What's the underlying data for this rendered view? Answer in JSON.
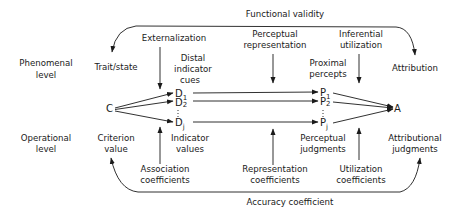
{
  "diagram": {
    "top_arc_label": "Functional validity",
    "bottom_arc_label": "Accuracy coefficient",
    "levels": {
      "phenomenal": [
        "Phenomenal",
        "level"
      ],
      "operational": [
        "Operational",
        "level"
      ]
    },
    "phenomenal_row": {
      "trait_state": "Trait/state",
      "externalization": "Externalization",
      "distal_cues": [
        "Distal",
        "indicator",
        "cues"
      ],
      "perceptual_representation": [
        "Perceptual",
        "representation"
      ],
      "proximal_percepts": [
        "Proximal",
        "percepts"
      ],
      "inferential_utilization": [
        "Inferential",
        "utilization"
      ],
      "attribution": "Attribution"
    },
    "nodes": {
      "criterion": "C",
      "distal": [
        {
          "base": "D",
          "sub": "1"
        },
        {
          "base": "D",
          "sub": "2"
        },
        {
          "base": "D",
          "sub": "j"
        }
      ],
      "proximal": [
        {
          "base": "P",
          "sub": "1"
        },
        {
          "base": "P",
          "sub": "2"
        },
        {
          "base": "P",
          "sub": "j"
        }
      ],
      "attribution": "A"
    },
    "operational_row": {
      "criterion_value": [
        "Criterion",
        "value"
      ],
      "indicator_values": [
        "Indicator",
        "values"
      ],
      "perceptual_judgments": [
        "Perceptual",
        "judgments"
      ],
      "attributional_judgments": [
        "Attributional",
        "judgments"
      ],
      "association_coefficients": [
        "Association",
        "coefficients"
      ],
      "representation_coefficients": [
        "Representation",
        "coefficients"
      ],
      "utilization_coefficients": [
        "Utilization",
        "coefficients"
      ]
    },
    "colors": {
      "ink": "#1a1a1a",
      "background": "#ffffff"
    }
  }
}
